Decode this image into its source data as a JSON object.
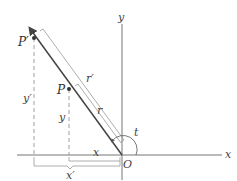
{
  "diagram": {
    "type": "geometric-scaling-figure",
    "colors": {
      "axis": "#666666",
      "ray": "#444444",
      "bracket": "#888888",
      "dashed": "#888888",
      "point": "#333333"
    },
    "axes": {
      "x_label": "x",
      "y_label": "y",
      "origin_label": "O"
    },
    "points": [
      {
        "id": "P",
        "label": "P"
      },
      {
        "id": "P_prime",
        "label": "P′"
      }
    ],
    "measurements": {
      "r": "r",
      "r_prime": "r′",
      "x": "x",
      "x_prime": "x′",
      "y": "y",
      "y_prime": "y′",
      "angle": "t"
    }
  }
}
